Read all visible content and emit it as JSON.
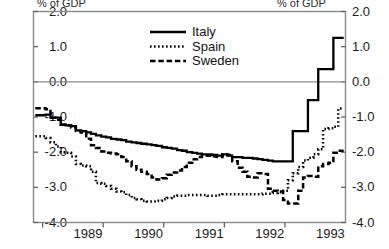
{
  "chart_data": {
    "type": "line",
    "title": "",
    "subtitle": "",
    "ylabel_left": "% of GDP",
    "ylabel_right": "% of GDP",
    "xlabel": "",
    "ylim": [
      -4.0,
      2.0
    ],
    "xlim": [
      1988.6,
      1993.75
    ],
    "grid": false,
    "zero_line": true,
    "legend_position": "top-center",
    "y_ticks": [
      "2.0",
      "1.0",
      "0.0",
      "-1.0",
      "-2.0",
      "-3.0",
      "-4.0"
    ],
    "y_tick_values": [
      2.0,
      1.0,
      0.0,
      -1.0,
      -2.0,
      -3.0,
      -4.0
    ],
    "x_ticks": [
      "1989",
      "1990",
      "1991",
      "1992",
      "1993"
    ],
    "x_tick_values": [
      1989,
      1990,
      1991,
      1992,
      1993
    ],
    "legend": [
      "Italy",
      "Spain",
      "Sweden"
    ],
    "series": [
      {
        "name": "Italy",
        "style": "solid",
        "color": "#000000",
        "x": [
          1988.63,
          1988.72,
          1988.8,
          1988.88,
          1988.97,
          1989.05,
          1989.13,
          1989.22,
          1989.3,
          1989.38,
          1989.47,
          1989.55,
          1989.63,
          1989.72,
          1989.8,
          1989.88,
          1989.97,
          1990.05,
          1990.13,
          1990.22,
          1990.3,
          1990.38,
          1990.47,
          1990.55,
          1990.63,
          1990.72,
          1990.8,
          1990.88,
          1990.97,
          1991.05,
          1991.13,
          1991.22,
          1991.3,
          1991.38,
          1991.47,
          1991.55,
          1991.63,
          1991.72,
          1991.8,
          1991.88,
          1991.97,
          1992.05,
          1992.13,
          1992.22,
          1992.3,
          1992.38,
          1992.47,
          1992.55,
          1992.63,
          1992.72,
          1992.8,
          1992.88,
          1992.97,
          1993.05,
          1993.13,
          1993.22,
          1993.3,
          1993.38,
          1993.47,
          1993.55,
          1993.63,
          1993.72
        ],
        "y": [
          -0.95,
          -0.95,
          -0.93,
          -1.02,
          -1.02,
          -1.22,
          -1.24,
          -1.26,
          -1.38,
          -1.4,
          -1.44,
          -1.48,
          -1.52,
          -1.56,
          -1.58,
          -1.62,
          -1.64,
          -1.66,
          -1.7,
          -1.72,
          -1.74,
          -1.76,
          -1.78,
          -1.8,
          -1.82,
          -1.86,
          -1.88,
          -1.9,
          -1.94,
          -1.96,
          -2.0,
          -2.02,
          -2.04,
          -2.06,
          -2.06,
          -2.08,
          -2.1,
          -2.06,
          -2.1,
          -2.14,
          -2.14,
          -2.16,
          -2.16,
          -2.18,
          -2.2,
          -2.22,
          -2.24,
          -2.26,
          -2.26,
          -2.26,
          -2.26,
          -1.4,
          -1.4,
          -1.4,
          -0.52,
          -0.52,
          0.36,
          0.36,
          0.36,
          1.25,
          1.25,
          1.25
        ]
      },
      {
        "name": "Spain",
        "style": "dotted",
        "color": "#000000",
        "x": [
          1988.63,
          1988.72,
          1988.8,
          1988.88,
          1988.97,
          1989.05,
          1989.13,
          1989.22,
          1989.3,
          1989.38,
          1989.47,
          1989.55,
          1989.63,
          1989.72,
          1989.8,
          1989.88,
          1989.97,
          1990.05,
          1990.13,
          1990.22,
          1990.3,
          1990.38,
          1990.47,
          1990.55,
          1990.63,
          1990.72,
          1990.8,
          1990.88,
          1990.97,
          1991.05,
          1991.13,
          1991.22,
          1991.3,
          1991.38,
          1991.47,
          1991.55,
          1991.63,
          1991.72,
          1991.8,
          1991.88,
          1991.97,
          1992.05,
          1992.13,
          1992.22,
          1992.3,
          1992.38,
          1992.47,
          1992.55,
          1992.63,
          1992.72,
          1992.8,
          1992.88,
          1992.97,
          1993.05,
          1993.13,
          1993.22,
          1993.3,
          1993.38,
          1993.47,
          1993.55,
          1993.63,
          1993.72
        ],
        "y": [
          -1.55,
          -1.55,
          -1.6,
          -1.72,
          -1.84,
          -2.0,
          -2.02,
          -2.12,
          -2.34,
          -2.38,
          -2.4,
          -2.56,
          -2.88,
          -2.9,
          -2.96,
          -3.04,
          -3.12,
          -3.14,
          -3.22,
          -3.3,
          -3.34,
          -3.38,
          -3.4,
          -3.4,
          -3.38,
          -3.34,
          -3.3,
          -3.26,
          -3.24,
          -3.24,
          -3.22,
          -3.22,
          -3.22,
          -3.22,
          -3.24,
          -3.24,
          -3.22,
          -3.2,
          -3.2,
          -3.2,
          -3.2,
          -3.2,
          -3.2,
          -3.2,
          -3.2,
          -3.18,
          -3.18,
          -3.16,
          -3.14,
          -3.1,
          -2.8,
          -2.6,
          -2.42,
          -2.24,
          -2.16,
          -2.06,
          -1.92,
          -1.34,
          -1.32,
          -1.28,
          -0.76,
          -0.76
        ]
      },
      {
        "name": "Sweden",
        "style": "dashed",
        "color": "#000000",
        "x": [
          1988.63,
          1988.72,
          1988.8,
          1988.88,
          1988.97,
          1989.05,
          1989.13,
          1989.22,
          1989.3,
          1989.38,
          1989.47,
          1989.55,
          1989.63,
          1989.72,
          1989.8,
          1989.88,
          1989.97,
          1990.05,
          1990.13,
          1990.22,
          1990.3,
          1990.38,
          1990.47,
          1990.55,
          1990.63,
          1990.72,
          1990.8,
          1990.88,
          1990.97,
          1991.05,
          1991.13,
          1991.22,
          1991.3,
          1991.38,
          1991.47,
          1991.55,
          1991.63,
          1991.72,
          1991.8,
          1991.88,
          1991.97,
          1992.05,
          1992.13,
          1992.22,
          1992.3,
          1992.38,
          1992.47,
          1992.55,
          1992.63,
          1992.72,
          1992.8,
          1992.88,
          1992.97,
          1993.05,
          1993.13,
          1993.22,
          1993.3,
          1993.38,
          1993.47,
          1993.55,
          1993.63,
          1993.72
        ],
        "y": [
          -0.75,
          -0.75,
          -0.78,
          -1.02,
          -1.08,
          -1.22,
          -1.24,
          -1.3,
          -1.4,
          -1.44,
          -1.62,
          -1.8,
          -1.88,
          -1.98,
          -2.02,
          -2.04,
          -2.06,
          -2.14,
          -2.26,
          -2.4,
          -2.5,
          -2.56,
          -2.62,
          -2.72,
          -2.78,
          -2.74,
          -2.64,
          -2.58,
          -2.52,
          -2.42,
          -2.3,
          -2.2,
          -2.14,
          -2.1,
          -2.1,
          -2.12,
          -2.14,
          -2.06,
          -2.08,
          -2.26,
          -2.44,
          -2.56,
          -2.7,
          -2.72,
          -2.6,
          -2.62,
          -3.04,
          -3.1,
          -3.12,
          -3.36,
          -3.46,
          -3.46,
          -3.1,
          -2.72,
          -2.68,
          -2.7,
          -2.4,
          -2.34,
          -2.3,
          -2.02,
          -1.96,
          -1.96
        ]
      }
    ]
  }
}
